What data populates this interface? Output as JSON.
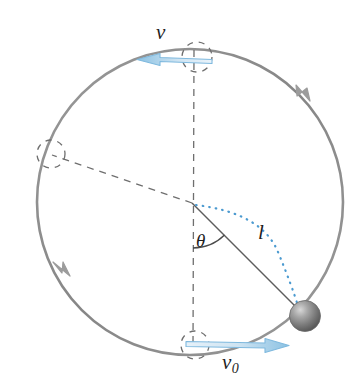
{
  "figure": {
    "kind": "physics-diagram",
    "background_color": "#ffffff"
  },
  "labels": {
    "velocity_top": "v",
    "angle": "θ",
    "length": "l",
    "velocity_initial_symbol": "v",
    "velocity_initial_subscript": "0"
  },
  "colors": {
    "circle_stroke": "#8c8c8c",
    "dashed_stroke": "#6e6e6e",
    "arrow_blue_light": "#cfe4f2",
    "arrow_blue_dark": "#5fa8d6",
    "arrow_blue_edge": "#6aaed8",
    "dotted_arc": "#4b9ad0",
    "sphere_light": "#d9d9d9",
    "sphere_mid": "#9a9a9a",
    "sphere_dark": "#5a5a5a",
    "text": "#1d1d1d"
  },
  "geometry": {
    "circle_center_x": 190,
    "circle_center_y": 202,
    "circle_radius": 153,
    "sphere_center_x": 305,
    "sphere_center_y": 316,
    "sphere_radius": 15,
    "pivot_x": 192,
    "pivot_y": 203,
    "angle_theta_degrees": 45
  },
  "elements": {
    "main_circle_name": "circular-path",
    "top_marker_name": "top-position-marker",
    "bottom_marker_name": "bottom-position-marker",
    "left_marker_name": "left-position-marker",
    "top_arrow_name": "velocity-arrow-top",
    "bottom_arrow_name": "velocity-arrow-bottom",
    "string_name": "string-line",
    "arc_name": "angle-arc",
    "dotted_arc_name": "swept-angle-dotted-arc",
    "sphere_name": "ball",
    "direction_arrowhead_upper_name": "direction-arrowhead-upper-right",
    "direction_arrowhead_lower_name": "direction-arrowhead-lower-left"
  }
}
